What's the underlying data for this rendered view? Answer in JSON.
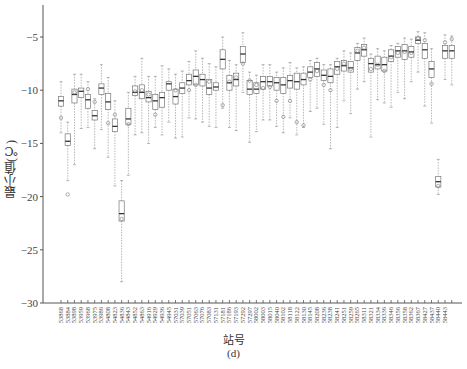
{
  "chart_data": {
    "type": "box",
    "title": "",
    "xlabel": "站号",
    "ylabel": "最小值(℃)",
    "caption": "(d)",
    "ylim": [
      -30,
      -3
    ],
    "yticks": [
      -5,
      -10,
      -15,
      -20,
      -25,
      -30
    ],
    "grid": false,
    "categories": [
      "53868",
      "53884",
      "53898",
      "53959",
      "53968",
      "53975",
      "53986",
      "54808",
      "54823",
      "54836",
      "54843",
      "54852",
      "54863",
      "54916",
      "54929",
      "54936",
      "54945",
      "57031",
      "57039",
      "57051",
      "57063",
      "57076",
      "57083",
      "57131",
      "57181",
      "57186",
      "57193",
      "57292",
      "57297",
      "58002",
      "58003",
      "58015",
      "58040",
      "58102",
      "58118",
      "58122",
      "58130",
      "58145",
      "58208",
      "58236",
      "58238",
      "58241",
      "58251",
      "58259",
      "58265",
      "58311",
      "58321",
      "58334",
      "58336",
      "58346",
      "58356",
      "58358",
      "58362",
      "58367",
      "58427",
      "58437",
      "58440",
      "58443"
    ],
    "boxes": [
      {
        "q1": -11.5,
        "median": -11.0,
        "q3": -10.6,
        "min": -14.0,
        "max": -9.2,
        "outliers": [
          -12.6
        ]
      },
      {
        "q1": -15.2,
        "median": -14.8,
        "q3": -14.1,
        "min": -18.5,
        "max": -13.0,
        "outliers": [
          -19.8
        ]
      },
      {
        "q1": -11.2,
        "median": -10.4,
        "q3": -9.9,
        "min": -17.0,
        "max": -8.5,
        "outliers": [
          -10.2
        ]
      },
      {
        "q1": -10.7,
        "median": -10.1,
        "q3": -9.8,
        "min": -13.6,
        "max": -8.5,
        "outliers": []
      },
      {
        "q1": -11.7,
        "median": -10.9,
        "q3": -10.4,
        "min": -13.5,
        "max": -9.2,
        "outliers": [
          -9.9
        ]
      },
      {
        "q1": -12.8,
        "median": -12.4,
        "q3": -11.9,
        "min": -15.5,
        "max": -10.8,
        "outliers": [
          -11.1
        ]
      },
      {
        "q1": -10.4,
        "median": -9.8,
        "q3": -9.4,
        "min": -13.7,
        "max": -7.6,
        "outliers": []
      },
      {
        "q1": -11.8,
        "median": -11.1,
        "q3": -10.3,
        "min": -16.3,
        "max": -8.8,
        "outliers": [
          -13.1
        ]
      },
      {
        "q1": -13.9,
        "median": -13.4,
        "q3": -12.7,
        "min": -19.0,
        "max": -11.0,
        "outliers": [
          -12.3
        ]
      },
      {
        "q1": -22.3,
        "median": -21.6,
        "q3": -20.4,
        "min": -28.0,
        "max": -18.5,
        "outliers": [
          -22.1
        ]
      },
      {
        "q1": -13.2,
        "median": -12.7,
        "q3": -11.7,
        "min": -18.0,
        "max": -10.2,
        "outliers": [
          -13.2
        ]
      },
      {
        "q1": -10.5,
        "median": -10.2,
        "q3": -9.6,
        "min": -14.2,
        "max": -8.7,
        "outliers": [
          -10.1
        ]
      },
      {
        "q1": -10.8,
        "median": -10.2,
        "q3": -9.5,
        "min": -14.0,
        "max": -7.0,
        "outliers": [
          -10.0
        ]
      },
      {
        "q1": -11.1,
        "median": -10.7,
        "q3": -10.1,
        "min": -15.0,
        "max": -8.7,
        "outliers": [
          -10.4
        ]
      },
      {
        "q1": -11.8,
        "median": -11.0,
        "q3": -10.4,
        "min": -13.5,
        "max": -8.7,
        "outliers": [
          -12.3
        ]
      },
      {
        "q1": -11.6,
        "median": -10.7,
        "q3": -10.2,
        "min": -14.2,
        "max": -7.7,
        "outliers": []
      },
      {
        "q1": -10.0,
        "median": -9.4,
        "q3": -9.2,
        "min": -13.0,
        "max": -8.0,
        "outliers": []
      },
      {
        "q1": -11.3,
        "median": -10.6,
        "q3": -9.9,
        "min": -14.5,
        "max": -8.5,
        "outliers": [
          -10.0
        ]
      },
      {
        "q1": -10.3,
        "median": -9.8,
        "q3": -9.3,
        "min": -14.4,
        "max": -8.2,
        "outliers": []
      },
      {
        "q1": -9.5,
        "median": -9.1,
        "q3": -8.5,
        "min": -12.6,
        "max": -7.3,
        "outliers": [
          -10.0
        ]
      },
      {
        "q1": -9.5,
        "median": -8.7,
        "q3": -8.1,
        "min": -12.7,
        "max": -6.3,
        "outliers": [
          -9.5
        ]
      },
      {
        "q1": -9.6,
        "median": -9.0,
        "q3": -8.5,
        "min": -13.0,
        "max": -7.0,
        "outliers": []
      },
      {
        "q1": -10.4,
        "median": -9.8,
        "q3": -9.0,
        "min": -13.4,
        "max": -7.5,
        "outliers": [
          -9.2
        ]
      },
      {
        "q1": -10.0,
        "median": -9.7,
        "q3": -9.3,
        "min": -13.5,
        "max": -7.8,
        "outliers": []
      },
      {
        "q1": -8.0,
        "median": -7.1,
        "q3": -6.2,
        "min": -11.7,
        "max": -5.0,
        "outliers": [
          -11.4
        ]
      },
      {
        "q1": -10.0,
        "median": -9.3,
        "q3": -8.6,
        "min": -13.5,
        "max": -7.2,
        "outliers": [
          -9.2
        ]
      },
      {
        "q1": -9.6,
        "median": -9.0,
        "q3": -8.4,
        "min": -13.8,
        "max": -7.6,
        "outliers": [
          -8.8
        ]
      },
      {
        "q1": -7.4,
        "median": -6.6,
        "q3": -5.9,
        "min": -10.2,
        "max": -4.6,
        "outliers": [
          -7.5
        ]
      },
      {
        "q1": -10.4,
        "median": -9.9,
        "q3": -9.1,
        "min": -14.9,
        "max": -8.3,
        "outliers": [
          -9.1
        ]
      },
      {
        "q1": -10.3,
        "median": -9.9,
        "q3": -9.3,
        "min": -13.9,
        "max": -8.6,
        "outliers": [
          -9.5
        ]
      },
      {
        "q1": -9.9,
        "median": -9.2,
        "q3": -8.7,
        "min": -12.8,
        "max": -7.6,
        "outliers": [
          -9.8
        ]
      },
      {
        "q1": -9.6,
        "median": -9.2,
        "q3": -8.7,
        "min": -12.8,
        "max": -7.6,
        "outliers": [
          -9.7
        ]
      },
      {
        "q1": -10.0,
        "median": -9.3,
        "q3": -8.8,
        "min": -13.4,
        "max": -8.3,
        "outliers": [
          -11.0
        ]
      },
      {
        "q1": -10.3,
        "median": -9.5,
        "q3": -8.8,
        "min": -14.0,
        "max": -7.9,
        "outliers": [
          -12.5
        ]
      },
      {
        "q1": -9.8,
        "median": -9.1,
        "q3": -8.6,
        "min": -12.6,
        "max": -7.4,
        "outliers": [
          -11.0
        ]
      },
      {
        "q1": -9.9,
        "median": -9.2,
        "q3": -8.4,
        "min": -14.2,
        "max": -7.9,
        "outliers": [
          -13.0
        ]
      },
      {
        "q1": -9.5,
        "median": -9.0,
        "q3": -8.4,
        "min": -13.5,
        "max": -7.8,
        "outliers": [
          -13.3
        ]
      },
      {
        "q1": -8.8,
        "median": -8.3,
        "q3": -7.8,
        "min": -12.0,
        "max": -7.2,
        "outliers": [
          -9.0
        ]
      },
      {
        "q1": -8.7,
        "median": -8.0,
        "q3": -7.4,
        "min": -11.7,
        "max": -7.0,
        "outliers": [
          -8.2
        ]
      },
      {
        "q1": -9.1,
        "median": -8.6,
        "q3": -8.1,
        "min": -13.2,
        "max": -7.6,
        "outliers": [
          -9.5
        ]
      },
      {
        "q1": -9.3,
        "median": -8.7,
        "q3": -8.0,
        "min": -15.5,
        "max": -7.6,
        "outliers": [
          -10.0
        ]
      },
      {
        "q1": -8.5,
        "median": -7.8,
        "q3": -7.3,
        "min": -13.5,
        "max": -7.0,
        "outliers": [
          -8.0
        ]
      },
      {
        "q1": -8.2,
        "median": -7.7,
        "q3": -7.2,
        "min": -11.0,
        "max": -6.3,
        "outliers": [
          -7.5
        ]
      },
      {
        "q1": -8.3,
        "median": -7.9,
        "q3": -7.3,
        "min": -12.2,
        "max": -6.5,
        "outliers": [
          -8.0
        ]
      },
      {
        "q1": -7.2,
        "median": -6.5,
        "q3": -6.0,
        "min": -9.9,
        "max": -5.6,
        "outliers": [
          -6.3
        ]
      },
      {
        "q1": -6.8,
        "median": -6.2,
        "q3": -5.7,
        "min": -9.2,
        "max": -5.1,
        "outliers": [
          -6.0
        ]
      },
      {
        "q1": -8.3,
        "median": -7.5,
        "q3": -7.0,
        "min": -14.4,
        "max": -6.6,
        "outliers": [
          -8.0
        ]
      },
      {
        "q1": -8.0,
        "median": -7.6,
        "q3": -6.8,
        "min": -10.9,
        "max": -6.1,
        "outliers": [
          -7.6
        ]
      },
      {
        "q1": -8.2,
        "median": -7.6,
        "q3": -6.9,
        "min": -11.2,
        "max": -6.3,
        "outliers": [
          -8.2
        ]
      },
      {
        "q1": -7.3,
        "median": -6.8,
        "q3": -6.2,
        "min": -11.6,
        "max": -5.8,
        "outliers": [
          -6.9
        ]
      },
      {
        "q1": -6.9,
        "median": -6.3,
        "q3": -5.9,
        "min": -10.2,
        "max": -5.6,
        "outliers": [
          -6.5
        ]
      },
      {
        "q1": -7.1,
        "median": -6.3,
        "q3": -5.7,
        "min": -10.8,
        "max": -5.1,
        "outliers": [
          -6.4
        ]
      },
      {
        "q1": -6.9,
        "median": -6.4,
        "q3": -5.9,
        "min": -9.2,
        "max": -5.2,
        "outliers": [
          -6.5
        ]
      },
      {
        "q1": -5.6,
        "median": -5.3,
        "q3": -5.0,
        "min": -8.3,
        "max": -4.5,
        "outliers": [
          -5.1
        ]
      },
      {
        "q1": -7.0,
        "median": -6.2,
        "q3": -5.6,
        "min": -11.5,
        "max": -4.6,
        "outliers": [
          -5.3
        ]
      },
      {
        "q1": -8.8,
        "median": -8.0,
        "q3": -7.3,
        "min": -13.1,
        "max": -6.1,
        "outliers": [
          -9.4
        ]
      },
      {
        "q1": -19.1,
        "median": -18.6,
        "q3": -18.1,
        "min": -19.8,
        "max": -16.5,
        "outliers": [
          -19.0
        ]
      },
      {
        "q1": -7.0,
        "median": -6.3,
        "q3": -5.8,
        "min": -9.0,
        "max": -4.8,
        "outliers": [
          -5.5
        ]
      },
      {
        "q1": -7.0,
        "median": -6.3,
        "q3": -5.8,
        "min": -9.5,
        "max": -4.9,
        "outliers": [
          -5.2
        ]
      }
    ]
  }
}
